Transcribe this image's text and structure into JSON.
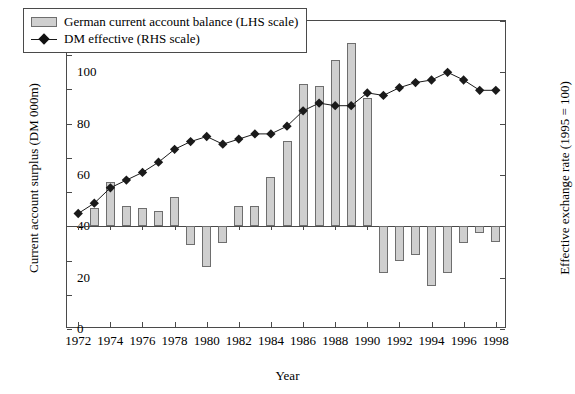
{
  "chart_data": {
    "type": "bar",
    "title": "",
    "xlabel": "Year",
    "ylabel": "Current account surplus (DM 000m)",
    "ylabel_right": "Effective exchange rate (1995 = 100)",
    "grid": false,
    "legend_position": "top-left",
    "ylim": [
      -60,
      120
    ],
    "ylim_right": [
      0,
      120
    ],
    "yticks": [
      -60,
      -40,
      -20,
      0,
      20,
      40,
      60,
      80,
      100,
      120
    ],
    "ytick_labels": [
      "–60",
      "–40",
      "–20",
      "0",
      "20",
      "40",
      "60",
      "80",
      "100",
      "120"
    ],
    "yticks_right": [
      0,
      20,
      40,
      60,
      80,
      100,
      120
    ],
    "ytick_labels_right": [
      "0",
      "20",
      "40",
      "60",
      "80",
      "100",
      "120"
    ],
    "xlim": [
      1971.3,
      1998.7
    ],
    "xticks": [
      1972,
      1974,
      1976,
      1978,
      1980,
      1982,
      1984,
      1986,
      1988,
      1990,
      1992,
      1994,
      1996,
      1998
    ],
    "xtick_labels": [
      "1972",
      "1974",
      "1976",
      "1978",
      "1980",
      "1982",
      "1984",
      "1986",
      "1988",
      "1990",
      "1992",
      "1994",
      "1996",
      "1998"
    ],
    "categories": [
      1972,
      1973,
      1974,
      1975,
      1976,
      1977,
      1978,
      1979,
      1980,
      1981,
      1982,
      1983,
      1984,
      1985,
      1986,
      1987,
      1988,
      1989,
      1990,
      1991,
      1992,
      1993,
      1994,
      1995,
      1996,
      1997,
      1998
    ],
    "series": [
      {
        "name": "German current account balance (LHS scale)",
        "axis": "left",
        "type": "bar",
        "color": "#cfcfcf",
        "edgecolor": "#6e6e6e",
        "values": [
          0,
          11,
          26,
          12,
          11,
          9,
          17,
          -11,
          -24,
          -10,
          12,
          12,
          29,
          50,
          83,
          82,
          97,
          107,
          75,
          -27,
          -20,
          -17,
          -35,
          -27,
          -10,
          -4,
          -9
        ]
      },
      {
        "name": "DM effective (RHS scale)",
        "axis": "right",
        "type": "line",
        "color": "#1a1a1a",
        "marker": "diamond",
        "values": [
          45,
          49,
          55,
          58,
          61,
          65,
          70,
          73,
          75,
          72,
          74,
          76,
          76,
          79,
          85,
          88,
          87,
          87,
          92,
          91,
          94,
          96,
          97,
          100,
          97,
          93,
          93
        ]
      }
    ]
  },
  "legend": {
    "items": [
      {
        "label": "German current account balance (LHS scale)",
        "marker": "swatch"
      },
      {
        "label": "DM effective (RHS scale)",
        "marker": "line-diamond"
      }
    ]
  }
}
